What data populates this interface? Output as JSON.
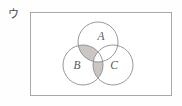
{
  "figure": {
    "choice_label": "ウ",
    "width": 182,
    "height": 106,
    "background_color": "#fefefe",
    "universe_rect": {
      "x": 30,
      "y": 12,
      "width": 142,
      "height": 84,
      "stroke_color": "#a8a8a8",
      "fill_color": "#ffffff"
    },
    "circle_stroke_color": "#8d8d8d",
    "shade_color": "#c9c6c4",
    "sets": [
      {
        "id": "A",
        "label": "A",
        "cx": 98,
        "cy": 42,
        "r": 20,
        "label_x": 101,
        "label_y": 40
      },
      {
        "id": "B",
        "label": "B",
        "cx": 83,
        "cy": 65,
        "r": 20,
        "label_x": 77,
        "label_y": 69
      },
      {
        "id": "C",
        "label": "C",
        "cx": 113,
        "cy": 65,
        "r": 20,
        "label_x": 114,
        "label_y": 69
      }
    ],
    "shaded_regions": [
      {
        "id": "A-and-B-not-C",
        "description": "A ∩ B excluding C",
        "expression": "A ∩ B ∩ Cᶜ"
      },
      {
        "id": "B-and-C-not-A",
        "description": "B ∩ C excluding A",
        "expression": "B ∩ C ∩ Aᶜ"
      }
    ]
  }
}
